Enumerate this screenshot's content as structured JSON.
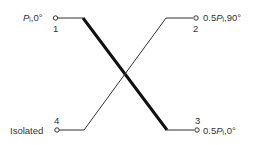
{
  "diagram": {
    "type": "directional-coupler",
    "ports": [
      {
        "number": "1",
        "label_symbol": "P",
        "label_sub": "i",
        "label_rest": ",0°"
      },
      {
        "number": "2",
        "label_prefix": "0.5",
        "label_symbol": "P",
        "label_sub": "i",
        "label_rest": ",90°"
      },
      {
        "number": "3",
        "label_prefix": "0.5",
        "label_symbol": "P",
        "label_sub": "i",
        "label_rest": ",0°"
      },
      {
        "number": "4",
        "label_text": "Isolated"
      }
    ],
    "connections": [
      {
        "from": "1",
        "to": "3",
        "style": "thick"
      },
      {
        "from": "4",
        "to": "2",
        "style": "thin"
      }
    ],
    "colors": {
      "line": "#111111",
      "text": "#333333"
    }
  }
}
